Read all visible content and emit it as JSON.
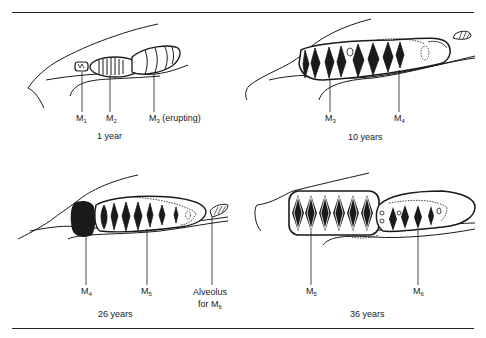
{
  "figure": {
    "panels": [
      {
        "id": "1-year",
        "caption": "1 year",
        "labels": [
          {
            "base": "M",
            "sub": "1",
            "suffix": ""
          },
          {
            "base": "M",
            "sub": "2",
            "suffix": ""
          },
          {
            "base": "M",
            "sub": "3",
            "suffix": " (erupting)"
          }
        ]
      },
      {
        "id": "10-years",
        "caption": "10 years",
        "labels": [
          {
            "base": "M",
            "sub": "3",
            "suffix": ""
          },
          {
            "base": "M",
            "sub": "4",
            "suffix": ""
          }
        ]
      },
      {
        "id": "26-years",
        "caption": "26 years",
        "labels": [
          {
            "base": "M",
            "sub": "4",
            "suffix": ""
          },
          {
            "base": "M",
            "sub": "5",
            "suffix": ""
          },
          {
            "line1": "Alveolus",
            "line2_prefix": "for M",
            "sub": "6"
          }
        ]
      },
      {
        "id": "36-years",
        "caption": "36 years",
        "labels": [
          {
            "base": "M",
            "sub": "5",
            "suffix": ""
          },
          {
            "base": "M",
            "sub": "6",
            "suffix": ""
          }
        ]
      }
    ],
    "colors": {
      "ink": "#1a1a1a",
      "background": "#ffffff"
    }
  }
}
